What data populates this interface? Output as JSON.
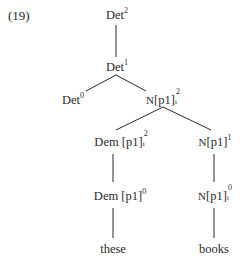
{
  "example_number": "(19)",
  "nodes": {
    "det2": {
      "base": "Det",
      "sup": "2"
    },
    "det1": {
      "base": "Det",
      "sup": "1"
    },
    "det0": {
      "base": "Det",
      "sup": "0"
    },
    "np_i_2": {
      "cat": "N",
      "feat": "[p1]",
      "sub": "i",
      "sup": "2"
    },
    "dem_i_2": {
      "cat": "Dem",
      "feat": "[p1]",
      "sub": "i",
      "sup": "2"
    },
    "np_1": {
      "cat": "N",
      "feat": "[p1]",
      "sup": "1"
    },
    "dem_0": {
      "cat": "Dem",
      "feat": "[p1]",
      "sup": "0"
    },
    "np_i_0": {
      "cat": "N",
      "feat": "[p1]",
      "sub": "i",
      "sup": "0"
    }
  },
  "leaves": {
    "these": "these",
    "books": "books"
  },
  "edges": [
    [
      "det2",
      "det1"
    ],
    [
      "det1",
      "det0"
    ],
    [
      "det1",
      "np_i_2"
    ],
    [
      "np_i_2",
      "dem_i_2"
    ],
    [
      "np_i_2",
      "np_1"
    ],
    [
      "dem_i_2",
      "dem_0"
    ],
    [
      "np_1",
      "np_i_0"
    ],
    [
      "dem_0",
      "these"
    ],
    [
      "np_i_0",
      "books"
    ]
  ],
  "line_color": "#2a2a2a"
}
